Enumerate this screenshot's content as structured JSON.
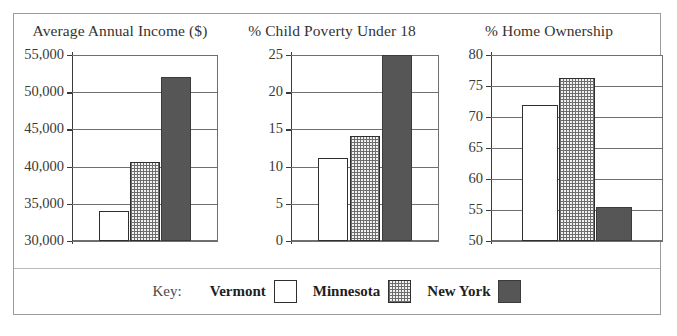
{
  "legend": {
    "key_label": "Key:",
    "items": [
      {
        "name": "Vermont",
        "swatch": "white-square-swatch",
        "color": "#ffffff"
      },
      {
        "name": "Minnesota",
        "swatch": "dotted-pattern-square-swatch",
        "color": "#f2f2f2"
      },
      {
        "name": "New York",
        "swatch": "dark-gray-square-swatch",
        "color": "#565656"
      }
    ]
  },
  "chart_data": [
    {
      "type": "bar",
      "title": "Average Annual Income ($)",
      "categories": [
        "Vermont",
        "Minnesota",
        "New York"
      ],
      "values": [
        34000,
        40600,
        52000
      ],
      "xlabel": "",
      "ylabel": "",
      "ylim": [
        30000,
        55000
      ],
      "yticks": [
        30000,
        35000,
        40000,
        45000,
        50000,
        55000
      ],
      "ytick_labels": [
        "30,000",
        "35,000",
        "40,000",
        "45,000",
        "50,000",
        "55,000"
      ],
      "grid": true,
      "legend_position": "bottom"
    },
    {
      "type": "bar",
      "title": "% Child Poverty Under 18",
      "categories": [
        "Vermont",
        "Minnesota",
        "New York"
      ],
      "values": [
        11.2,
        14.1,
        25.0
      ],
      "xlabel": "",
      "ylabel": "",
      "ylim": [
        0,
        25
      ],
      "yticks": [
        0,
        5,
        10,
        15,
        20,
        25
      ],
      "ytick_labels": [
        "0",
        "5",
        "10",
        "15",
        "20",
        "25"
      ],
      "grid": true,
      "legend_position": "bottom"
    },
    {
      "type": "bar",
      "title": "% Home Ownership",
      "categories": [
        "Vermont",
        "Minnesota",
        "New York"
      ],
      "values": [
        72.0,
        76.3,
        55.5
      ],
      "xlabel": "",
      "ylabel": "",
      "ylim": [
        50,
        80
      ],
      "yticks": [
        50,
        55,
        60,
        65,
        70,
        75,
        80
      ],
      "ytick_labels": [
        "50",
        "55",
        "60",
        "65",
        "70",
        "75",
        "80"
      ],
      "grid": true,
      "legend_position": "bottom"
    }
  ]
}
